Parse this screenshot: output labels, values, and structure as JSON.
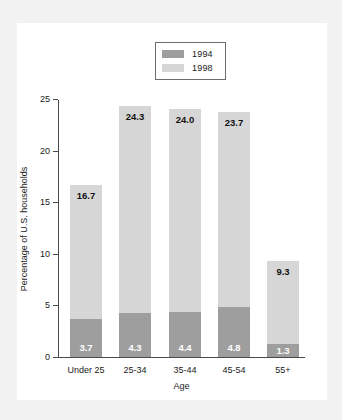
{
  "chart_data": {
    "type": "bar",
    "subtype": "stacked",
    "title": "",
    "xlabel": "Age",
    "ylabel": "Percentage of U.S. households",
    "categories": [
      "Under 25",
      "25-34",
      "35-44",
      "45-54",
      "55+"
    ],
    "series": [
      {
        "name": "1994",
        "color": "#9e9e9e",
        "values": [
          3.7,
          4.3,
          4.4,
          4.8,
          1.3
        ]
      },
      {
        "name": "1998",
        "color": "#d6d6d6",
        "values": [
          16.7,
          24.3,
          24.0,
          23.7,
          9.3
        ]
      }
    ],
    "stacking_note": "1998 value is the full bar height; 1994 value is drawn as the lower portion of the same bar",
    "ylim": [
      0,
      25
    ],
    "y_ticks": [
      "0",
      "5",
      "10",
      "15",
      "20",
      "25"
    ],
    "y_tick_values": [
      0,
      5,
      10,
      15,
      20,
      25
    ],
    "grid": false,
    "legend_position": "top-center",
    "legend_entries": [
      "1994",
      "1998"
    ],
    "data_labels": {
      "top": [
        "16.7",
        "24.3",
        "24.0",
        "23.7",
        "9.3"
      ],
      "bottom": [
        "3.7",
        "4.3",
        "4.4",
        "4.8",
        "1.3"
      ]
    }
  },
  "colors": {
    "page_background": "#f2f2f2",
    "card_background": "#ffffff",
    "axis": "#4a4a4a",
    "series_1994": "#9e9e9e",
    "series_1998": "#d6d6d6",
    "text": "#1a1a1a",
    "label_light": "#ffffff"
  }
}
